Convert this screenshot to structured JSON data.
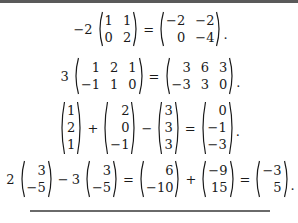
{
  "equations": [
    {
      "id": "eq1",
      "scalar": "−2",
      "lhs_matrix": [
        [
          "1",
          "1"
        ],
        [
          "0",
          "2"
        ]
      ],
      "eq": "=",
      "rhs_matrix": [
        [
          "−2",
          "−2"
        ],
        [
          "0",
          "−4"
        ]
      ],
      "end": "."
    },
    {
      "id": "eq2",
      "scalar": "3",
      "lhs_matrix": [
        [
          "1",
          "2",
          "1"
        ],
        [
          "−1",
          "1",
          "0"
        ]
      ],
      "eq": "=",
      "rhs_matrix": [
        [
          "3",
          "6",
          "3"
        ],
        [
          "−3",
          "3",
          "0"
        ]
      ],
      "end": "."
    },
    {
      "id": "eq3",
      "v1": [
        "1",
        "2",
        "1"
      ],
      "op1": "+",
      "v2": [
        "2",
        "0",
        "−1"
      ],
      "op2": "−",
      "v3": [
        "3",
        "3",
        "3"
      ],
      "eq": "=",
      "result": [
        "0",
        "−1",
        "−3"
      ],
      "end": "."
    },
    {
      "id": "eq4",
      "s1": "2",
      "v1": [
        "3",
        "−5"
      ],
      "op1": "−",
      "s2": "3",
      "v2": [
        "3",
        "−5"
      ],
      "eq1": "=",
      "v3": [
        "6",
        "−10"
      ],
      "op2": "+",
      "v4": [
        "−9",
        "15"
      ],
      "eq2": "=",
      "result": [
        "−3",
        "5"
      ],
      "end": "."
    }
  ]
}
